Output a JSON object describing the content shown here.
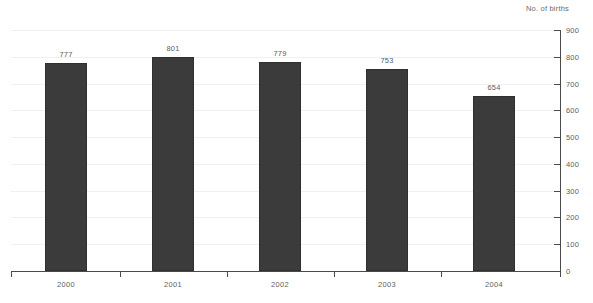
{
  "chart_data": {
    "type": "bar",
    "title": "",
    "subtitle": "",
    "axis_title": "No. of births",
    "xlabel": "",
    "ylabel": "No. of births",
    "categories": [
      "2000",
      "2001",
      "2002",
      "2003",
      "2004"
    ],
    "values": [
      777,
      801,
      779,
      753,
      654
    ],
    "data_labels": [
      "777",
      "801",
      "779",
      "753",
      "654"
    ],
    "ylim": [
      0,
      900
    ],
    "ytick_step": 100,
    "ytick_labels": [
      "0",
      "100",
      "200",
      "300",
      "400",
      "500",
      "600",
      "700",
      "800",
      "900"
    ],
    "grid": true,
    "grid_axis": "y",
    "legend": false,
    "legend_position": "none",
    "y_axis_side": "right",
    "series": [
      {
        "name": "No. of births",
        "values": [
          777,
          801,
          779,
          753,
          654
        ]
      }
    ]
  },
  "colors": {
    "bar_fill": "#3b3b3b",
    "bar_border": "#2f2f2f",
    "gridline": "#f0f0f0",
    "axis_line": "#4a4a4a",
    "label_text": "#5e5e5e",
    "title_text": "#6b6b6b",
    "background": "#ffffff"
  }
}
